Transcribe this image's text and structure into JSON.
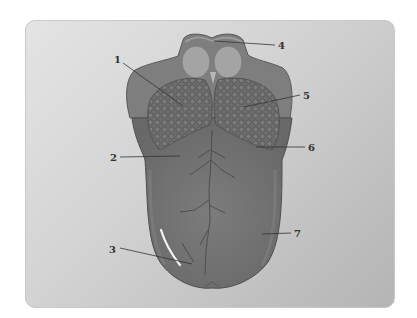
{
  "diagram": {
    "colors": {
      "frame_light": "#e4e4e4",
      "frame_dark": "#b4b4b4",
      "tongue_body": "#747474",
      "tongue_edge": "#555555",
      "papillae": "#6a6a6a",
      "root_region": "#8a8a8a",
      "tonsil_light": "#a8a8a8",
      "leader_line": "#333333"
    },
    "labels": [
      {
        "id": "1",
        "text": "1"
      },
      {
        "id": "2",
        "text": "2"
      },
      {
        "id": "3",
        "text": "3"
      },
      {
        "id": "4",
        "text": "4"
      },
      {
        "id": "5",
        "text": "5"
      },
      {
        "id": "6",
        "text": "6"
      },
      {
        "id": "7",
        "text": "7"
      }
    ]
  }
}
